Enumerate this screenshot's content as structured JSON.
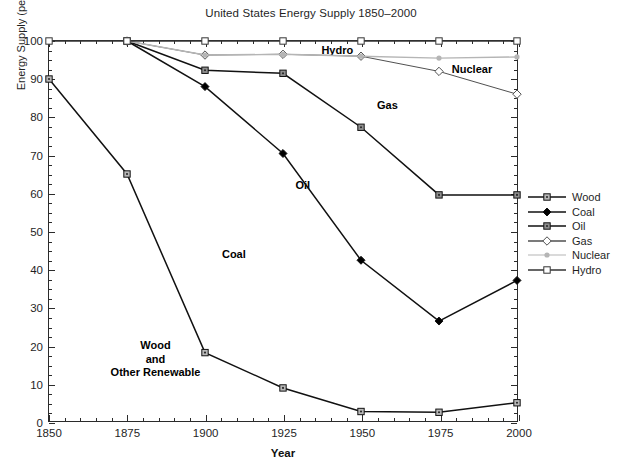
{
  "chart_data": {
    "type": "line",
    "title": "United States Energy Supply 1850–2000",
    "xlabel": "Year",
    "ylabel": "Energy Supply (percent)",
    "x": [
      1850,
      1875,
      1900,
      1925,
      1950,
      1975,
      2000
    ],
    "xlim": [
      1850,
      2000
    ],
    "ylim": [
      0,
      100
    ],
    "xticks": [
      1850,
      1875,
      1900,
      1925,
      1950,
      1975,
      2000
    ],
    "yticks": [
      0,
      10,
      20,
      30,
      40,
      50,
      60,
      70,
      80,
      90,
      100
    ],
    "grid": false,
    "legend_position": "right",
    "series": [
      {
        "name": "Wood",
        "marker": "square-dot",
        "color": "#111111",
        "marker_fill": "#b8b8b8",
        "x": [
          1850,
          1875,
          1900,
          1925,
          1950,
          1975,
          2000
        ],
        "values": [
          90,
          65,
          18,
          8.7,
          2.5,
          2.3,
          4.8
        ]
      },
      {
        "name": "Coal",
        "marker": "filled-diamond",
        "color": "#111111",
        "marker_fill": "#000000",
        "x": [
          1875,
          1900,
          1925,
          1950,
          1975,
          2000
        ],
        "values": [
          100,
          88,
          70.4,
          42.3,
          26.3,
          37
        ]
      },
      {
        "name": "Oil",
        "marker": "square-dot",
        "color": "#111111",
        "marker_fill": "#8f8f8f",
        "x": [
          1875,
          1900,
          1925,
          1950,
          1975,
          2000
        ],
        "values": [
          100,
          92.3,
          91.5,
          77.3,
          59.5,
          59.5
        ]
      },
      {
        "name": "Gas",
        "marker": "open-diamond",
        "color": "#4f4f4f",
        "marker_fill": "#ffffff",
        "x": [
          1875,
          1900,
          1925,
          1950,
          1975,
          2000
        ],
        "values": [
          100,
          96.3,
          96.5,
          96,
          92,
          86
        ]
      },
      {
        "name": "Nuclear",
        "marker": "dot",
        "color": "#b5b5b5",
        "marker_fill": "#b5b5b5",
        "x": [
          1875,
          1900,
          1925,
          1950,
          1975,
          2000
        ],
        "values": [
          100,
          96.3,
          96.5,
          96,
          95.5,
          95.8
        ]
      },
      {
        "name": "Hydro",
        "marker": "open-square",
        "color": "#333333",
        "marker_fill": "#ffffff",
        "x": [
          1850,
          1875,
          1900,
          1925,
          1950,
          1975,
          2000
        ],
        "values": [
          100,
          100,
          100,
          100,
          100,
          100,
          100
        ]
      }
    ],
    "annotations": [
      {
        "text": "Hydro",
        "x": 1942,
        "y": 97.5
      },
      {
        "text": "Nuclear",
        "x": 1985,
        "y": 92.5
      },
      {
        "text": "Gas",
        "x": 1958,
        "y": 83
      },
      {
        "text": "Oil",
        "x": 1931,
        "y": 62
      },
      {
        "text": "Coal",
        "x": 1909,
        "y": 44
      },
      {
        "text": "Wood\nand\nOther Renewable",
        "x": 1884,
        "y": 16.5
      }
    ]
  },
  "legend": {
    "items": [
      {
        "label": "Wood"
      },
      {
        "label": "Coal"
      },
      {
        "label": "Oil"
      },
      {
        "label": "Gas"
      },
      {
        "label": "Nuclear"
      },
      {
        "label": "Hydro"
      }
    ]
  }
}
